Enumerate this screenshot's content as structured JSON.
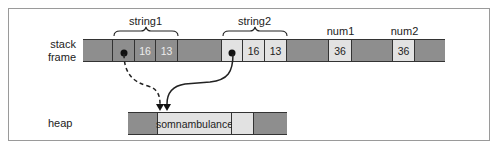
{
  "diagram": {
    "labels": {
      "stack_frame": "stack frame",
      "heap": "heap"
    },
    "stack": {
      "string1": {
        "label": "string1",
        "ptr": "",
        "capacity": "16",
        "length": "13"
      },
      "string2": {
        "label": "string2",
        "ptr": "",
        "capacity": "16",
        "length": "13"
      },
      "num1": {
        "label": "num1",
        "value": "36"
      },
      "num2": {
        "label": "num2",
        "value": "36"
      }
    },
    "heap": {
      "buffer_text": "somnambulance"
    },
    "colors": {
      "used_cell": "#8e8e8e",
      "active_cell": "#e2e2e2",
      "border": "#333333"
    },
    "arrows": [
      {
        "from": "string1.ptr",
        "to": "heap.buffer",
        "style": "dashed"
      },
      {
        "from": "string2.ptr",
        "to": "heap.buffer",
        "style": "solid"
      }
    ]
  }
}
